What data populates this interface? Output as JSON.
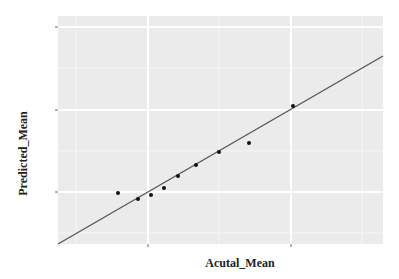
{
  "chart_data": {
    "type": "scatter",
    "title": "",
    "xlabel": "Acutal_Mean",
    "ylabel": "Predicted_Mean",
    "x_tick_labels": [],
    "y_tick_labels": [],
    "grid": true,
    "legend": null,
    "panel_background": "#ebebeb",
    "panel_px": {
      "left": 58,
      "top": 16,
      "right": 383,
      "bottom": 244
    },
    "x_major_ticks_px": [
      148,
      291
    ],
    "x_minor_ticks_px": [
      76,
      219,
      362
    ],
    "y_major_ticks_px": [
      27,
      110,
      192
    ],
    "y_minor_ticks_px": [
      68,
      151,
      233
    ],
    "points_px": [
      {
        "x": 118,
        "y": 193
      },
      {
        "x": 138,
        "y": 199
      },
      {
        "x": 151,
        "y": 195
      },
      {
        "x": 164,
        "y": 188
      },
      {
        "x": 178,
        "y": 176
      },
      {
        "x": 196,
        "y": 165
      },
      {
        "x": 219,
        "y": 152
      },
      {
        "x": 249,
        "y": 143
      },
      {
        "x": 293,
        "y": 106
      }
    ],
    "fit_line_px": {
      "x1": 58,
      "y1": 244,
      "x2": 383,
      "y2": 56
    },
    "point_color": "#111111",
    "line_color": "#555555"
  }
}
